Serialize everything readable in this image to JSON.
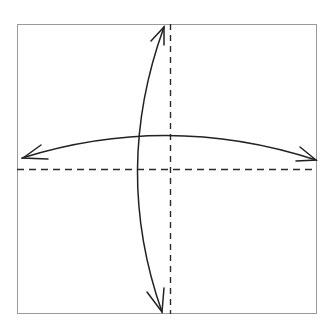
{
  "diagram": {
    "type": "origami-fold-instruction",
    "colors": {
      "background": "#ffffff",
      "paper_border": "#9a9a9a",
      "fold_line": "#2a2a2a",
      "arrow": "#222222"
    },
    "square": {
      "x": 17,
      "y": 24,
      "width": 300,
      "height": 290
    },
    "fold_lines": [
      {
        "name": "vertical-valley-fold",
        "x1": 170,
        "y1": 24,
        "x2": 170,
        "y2": 314,
        "style": "dashed"
      },
      {
        "name": "horizontal-valley-fold",
        "x1": 17,
        "y1": 169,
        "x2": 317,
        "y2": 169,
        "style": "dashed"
      }
    ],
    "arrows": [
      {
        "name": "horizontal-fold-unfold-arrow",
        "path": "M22,158 Q169,112 316,160",
        "heads": "both"
      },
      {
        "name": "vertical-fold-unfold-arrow",
        "path": "M164,26 Q112,170 162,312",
        "heads": "both"
      }
    ]
  }
}
